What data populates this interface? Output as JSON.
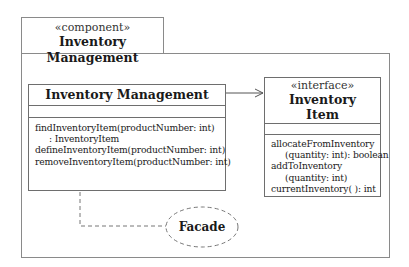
{
  "component": {
    "stereotype": "«component»",
    "name": "Inventory Management"
  },
  "management_class": {
    "name": "Inventory Management",
    "attributes": [],
    "operations": [
      {
        "text": "findInventoryItem(productNumber: int)",
        "indent": false
      },
      {
        "text": ": InventoryItem",
        "indent": true
      },
      {
        "text": "defineInventoryItem(productNumber: int)",
        "indent": false
      },
      {
        "text": "removeInventoryItem(productNumber: int)",
        "indent": false
      }
    ]
  },
  "inventory_item_interface": {
    "stereotype": "«interface»",
    "name_line1": "Inventory",
    "name_line2": "Item",
    "attributes": [],
    "operations": [
      {
        "text": "allocateFromInventory",
        "indent": false
      },
      {
        "text": "(quantity: int): boolean",
        "indent": true
      },
      {
        "text": "addToInventory",
        "indent": false
      },
      {
        "text": "(quantity: int)",
        "indent": true
      },
      {
        "text": "currentInventory( ): int",
        "indent": false
      }
    ]
  },
  "facade": {
    "label": "Facade"
  },
  "relationships": [
    {
      "from": "Inventory Management",
      "to": "Inventory Item",
      "type": "dependency-arrow"
    },
    {
      "from": "Inventory Management",
      "to": "Facade",
      "type": "dashed-link"
    }
  ]
}
